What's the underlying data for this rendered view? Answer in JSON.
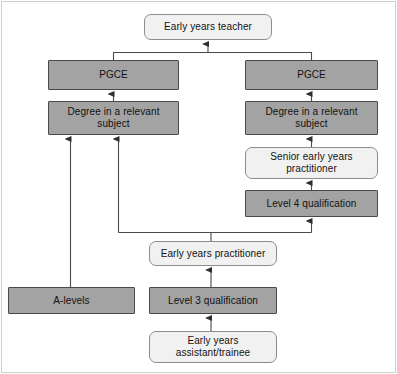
{
  "diagram": {
    "type": "flowchart",
    "colors": {
      "dark_node_fill": "#a3a3a3",
      "dark_node_border": "#4a4a4a",
      "light_node_fill": "#f1f1f1",
      "light_node_border": "#8d8d8d",
      "connector": "#404040",
      "frame_border": "#cfcfcf",
      "background": "#ffffff",
      "text": "#111111"
    },
    "nodes": [
      {
        "id": "early-years-teacher",
        "label": "Early years teacher",
        "style": "light",
        "x": 144,
        "y": 14,
        "w": 128,
        "h": 26
      },
      {
        "id": "pgce-left",
        "label": "PGCE",
        "style": "dark",
        "x": 48,
        "y": 60,
        "w": 131,
        "h": 30
      },
      {
        "id": "pgce-right",
        "label": "PGCE",
        "style": "dark",
        "x": 245,
        "y": 60,
        "w": 133,
        "h": 30
      },
      {
        "id": "degree-left",
        "label": "Degree in a relevant subject",
        "style": "dark",
        "x": 48,
        "y": 101,
        "w": 131,
        "h": 34
      },
      {
        "id": "degree-right",
        "label": "Degree in a relevant subject",
        "style": "dark",
        "x": 245,
        "y": 101,
        "w": 133,
        "h": 34
      },
      {
        "id": "senior-practitioner",
        "label": "Senior early years practitioner",
        "style": "light",
        "x": 245,
        "y": 147,
        "w": 133,
        "h": 32
      },
      {
        "id": "level-4",
        "label": "Level 4 qualification",
        "style": "dark",
        "x": 245,
        "y": 190,
        "w": 133,
        "h": 27
      },
      {
        "id": "early-years-practitioner",
        "label": "Early years practitioner",
        "style": "light",
        "x": 149,
        "y": 241,
        "w": 128,
        "h": 25
      },
      {
        "id": "a-levels",
        "label": "A-levels",
        "style": "dark",
        "x": 8,
        "y": 287,
        "w": 127,
        "h": 27
      },
      {
        "id": "level-3",
        "label": "Level 3 qualification",
        "style": "dark",
        "x": 149,
        "y": 287,
        "w": 128,
        "h": 27
      },
      {
        "id": "assistant-trainee",
        "label": "Early years assistant/trainee",
        "style": "light",
        "x": 149,
        "y": 331,
        "w": 128,
        "h": 32
      }
    ],
    "edges": [
      {
        "from": "pgce-left",
        "to": "early-years-teacher",
        "kind": "elbow-merge"
      },
      {
        "from": "pgce-right",
        "to": "early-years-teacher",
        "kind": "elbow-merge"
      },
      {
        "from": "degree-left",
        "to": "pgce-left",
        "kind": "straight"
      },
      {
        "from": "degree-right",
        "to": "pgce-right",
        "kind": "straight"
      },
      {
        "from": "senior-practitioner",
        "to": "degree-right",
        "kind": "straight"
      },
      {
        "from": "level-4",
        "to": "senior-practitioner",
        "kind": "straight"
      },
      {
        "from": "early-years-practitioner",
        "to": "level-4",
        "kind": "elbow"
      },
      {
        "from": "early-years-practitioner",
        "to": "degree-left",
        "kind": "elbow"
      },
      {
        "from": "a-levels",
        "to": "degree-left",
        "kind": "straight"
      },
      {
        "from": "level-3",
        "to": "early-years-practitioner",
        "kind": "straight"
      },
      {
        "from": "assistant-trainee",
        "to": "level-3",
        "kind": "straight"
      }
    ]
  }
}
